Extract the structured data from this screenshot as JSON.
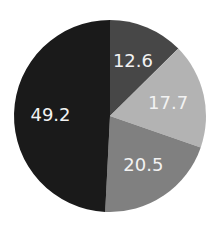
{
  "chart_data": {
    "type": "pie",
    "title": "",
    "categories": [
      "Slice 1",
      "Slice 2",
      "Slice 3",
      "Slice 4"
    ],
    "values": [
      12.6,
      17.7,
      20.5,
      49.2
    ],
    "labels": [
      "12.6",
      "17.7",
      "20.5",
      "49.2"
    ],
    "colors": [
      "#474747",
      "#b3b3b3",
      "#808080",
      "#1a1a1a"
    ],
    "start_angle": "12 o'clock",
    "direction": "clockwise",
    "legend": "none"
  },
  "layout": {
    "cx": 110,
    "cy": 116,
    "r": 96
  }
}
